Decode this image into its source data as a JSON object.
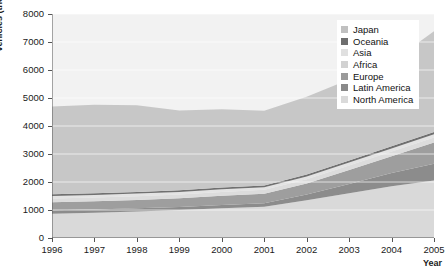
{
  "chart_data": {
    "type": "area",
    "title": "",
    "xlabel": "Year",
    "ylabel": "Vehicles (thousands)",
    "categories": [
      "1996",
      "1997",
      "1998",
      "1999",
      "2000",
      "2001",
      "2002",
      "2003",
      "2004",
      "2005"
    ],
    "x": [
      1996,
      1997,
      1998,
      1999,
      2000,
      2001,
      2002,
      2003,
      2004,
      2005
    ],
    "xlim": [
      1996,
      2005
    ],
    "ylim": [
      0,
      8000
    ],
    "yticks": [
      0,
      1000,
      2000,
      3000,
      4000,
      5000,
      6000,
      7000,
      8000
    ],
    "ytick_labels": [
      "0",
      "1000",
      "2000",
      "3000",
      "4000",
      "5000",
      "6000",
      "7000",
      "8000"
    ],
    "grid": true,
    "stacked": true,
    "legend_position": "top-right",
    "series": [
      {
        "name": "North America",
        "color": "#d9d9d9",
        "values": [
          870,
          900,
          950,
          1000,
          1060,
          1120,
          1350,
          1600,
          1850,
          2050
        ]
      },
      {
        "name": "Latin America",
        "color": "#8c8c8c",
        "values": [
          120,
          115,
          110,
          110,
          115,
          120,
          200,
          330,
          470,
          600
        ]
      },
      {
        "name": "Europe",
        "color": "#9e9e9e",
        "values": [
          290,
          300,
          300,
          310,
          330,
          340,
          400,
          500,
          600,
          760
        ]
      },
      {
        "name": "Africa",
        "color": "#dcdcdc",
        "values": [
          130,
          130,
          135,
          135,
          140,
          140,
          150,
          160,
          170,
          180
        ]
      },
      {
        "name": "Asia",
        "color": "#e3e3e3",
        "values": [
          90,
          90,
          90,
          90,
          95,
          95,
          100,
          105,
          110,
          115
        ]
      },
      {
        "name": "Oceania",
        "color": "#707070",
        "values": [
          60,
          60,
          60,
          60,
          60,
          60,
          65,
          70,
          75,
          80
        ]
      },
      {
        "name": "Japan",
        "color": "#c7c7c7",
        "values": [
          3140,
          3160,
          3100,
          2850,
          2800,
          2670,
          2780,
          2900,
          3010,
          3600
        ]
      }
    ],
    "stack_totals": [
      4700,
      4755,
      4745,
      4555,
      4600,
      4545,
      5045,
      5665,
      6285,
      7385
    ],
    "legend": [
      {
        "label": "Japan",
        "color": "#c0c0c0"
      },
      {
        "label": "Oceania",
        "color": "#6e6e6e"
      },
      {
        "label": "Asia",
        "color": "#e0e0e0"
      },
      {
        "label": "Africa",
        "color": "#d2d2d2"
      },
      {
        "label": "Europe",
        "color": "#9a9a9a"
      },
      {
        "label": "Latin America",
        "color": "#8a8a8a"
      },
      {
        "label": "North America",
        "color": "#dadada"
      }
    ],
    "colors": {
      "plot_background": "#f2f2f2",
      "gridline": "#ffffff",
      "axis": "#555555",
      "text": "#1a1a1a"
    }
  }
}
